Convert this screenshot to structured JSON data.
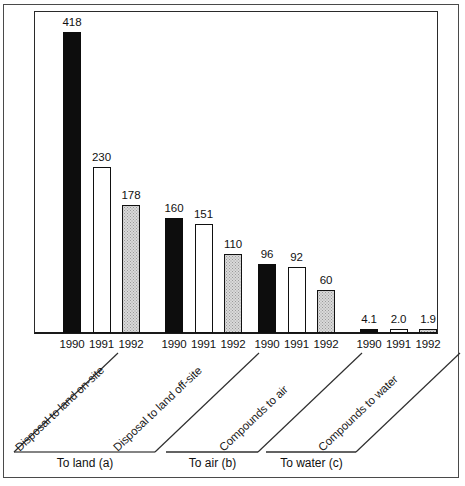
{
  "chart_data": {
    "type": "bar",
    "title": "",
    "subtitle": "",
    "xlabel": "",
    "ylabel": "",
    "grid": false,
    "legend": "none",
    "ylim": [
      0,
      418
    ],
    "value_axis_note": "bar heights drawn proportional to value; no numeric y-axis ticks shown",
    "categories": [
      "Disposal to land on-site",
      "Disposal to land off-site",
      "Compounds to air",
      "Compounds to water"
    ],
    "x": [
      "1990",
      "1991",
      "1992"
    ],
    "series": [
      {
        "name": "1990",
        "fill": "solid-black",
        "values": [
          418,
          160,
          96,
          4.1
        ]
      },
      {
        "name": "1991",
        "fill": "open-white",
        "values": [
          230,
          151,
          92,
          2.0
        ]
      },
      {
        "name": "1992",
        "fill": "gray-stipple",
        "values": [
          178,
          110,
          60,
          1.9
        ]
      }
    ],
    "bars": [
      {
        "group": 0,
        "year": "1990",
        "value": 418,
        "label": "418",
        "fill": "solid-black"
      },
      {
        "group": 0,
        "year": "1991",
        "value": 230,
        "label": "230",
        "fill": "open-white"
      },
      {
        "group": 0,
        "year": "1992",
        "value": 178,
        "label": "178",
        "fill": "gray-stipple"
      },
      {
        "group": 1,
        "year": "1990",
        "value": 160,
        "label": "160",
        "fill": "solid-black"
      },
      {
        "group": 1,
        "year": "1991",
        "value": 151,
        "label": "151",
        "fill": "open-white"
      },
      {
        "group": 1,
        "year": "1992",
        "value": 110,
        "label": "110",
        "fill": "gray-stipple"
      },
      {
        "group": 2,
        "year": "1990",
        "value": 96,
        "label": "96",
        "fill": "solid-black"
      },
      {
        "group": 2,
        "year": "1991",
        "value": 92,
        "label": "92",
        "fill": "open-white"
      },
      {
        "group": 2,
        "year": "1992",
        "value": 60,
        "label": "60",
        "fill": "gray-stipple"
      },
      {
        "group": 3,
        "year": "1990",
        "value": 4.1,
        "label": "4.1",
        "fill": "solid-black"
      },
      {
        "group": 3,
        "year": "1991",
        "value": 2.0,
        "label": "2.0",
        "fill": "open-white"
      },
      {
        "group": 3,
        "year": "1992",
        "value": 1.9,
        "label": "1.9",
        "fill": "gray-stipple"
      }
    ],
    "annotations": {
      "diagonal_labels": [
        "Disposal to land on-site",
        "Disposal to land off-site",
        "Compounds to air",
        "Compounds to water"
      ],
      "group_labels": [
        "To land (a)",
        "To air (b)",
        "To water (c)"
      ]
    }
  },
  "colors": {
    "bar_1990": "#0d0d0d",
    "bar_1991": "#ffffff",
    "bar_1992": "#d9d9d9",
    "outline": "#111111",
    "frame": "#4a4a4a",
    "axis": "#1a1a1a",
    "text": "#111111"
  }
}
